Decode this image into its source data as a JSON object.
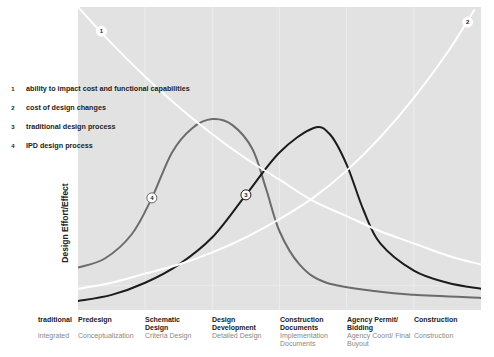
{
  "chart_data": {
    "type": "line",
    "title": "",
    "ylabel": "Design Effort/Effect",
    "xlabel": "",
    "grid": "vertical, faint, at phase boundaries",
    "plot_area": {
      "x0": 78,
      "y0": 7,
      "x1": 481,
      "y1": 310
    },
    "x_categories_traditional": [
      "Predesign",
      "Schematic Design",
      "Design Development",
      "Construction Documents",
      "Agency Permit/ Bidding",
      "Construction"
    ],
    "x_categories_integrated": [
      "Conceptualization",
      "Criteria Design",
      "Detailed Design",
      "Implementation Documents",
      "Agency Coord/ Final Buyout",
      "Construction"
    ],
    "x_range": [
      0,
      6
    ],
    "y_range": [
      0,
      100
    ],
    "series": [
      {
        "id": "1",
        "name": "ability to impact cost and functional capabilities",
        "color": "#ffffff",
        "width": 2,
        "points": [
          [
            0.0,
            100
          ],
          [
            0.5,
            88
          ],
          [
            1.0,
            77
          ],
          [
            1.5,
            67
          ],
          [
            2.0,
            58
          ],
          [
            2.5,
            50
          ],
          [
            3.0,
            43
          ],
          [
            3.5,
            36
          ],
          [
            4.0,
            31
          ],
          [
            4.5,
            26
          ],
          [
            5.0,
            22
          ],
          [
            5.5,
            18
          ],
          [
            6.0,
            15
          ]
        ],
        "marker": {
          "x": 0.35,
          "y": 92
        }
      },
      {
        "id": "2",
        "name": "cost of design changes",
        "color": "#ffffff",
        "width": 2,
        "points": [
          [
            0.0,
            7
          ],
          [
            0.5,
            9
          ],
          [
            1.0,
            12
          ],
          [
            1.5,
            15
          ],
          [
            2.0,
            19
          ],
          [
            2.5,
            24
          ],
          [
            3.0,
            30
          ],
          [
            3.5,
            37
          ],
          [
            4.0,
            46
          ],
          [
            4.5,
            57
          ],
          [
            5.0,
            70
          ],
          [
            5.5,
            85
          ],
          [
            5.9,
            99
          ]
        ],
        "marker": {
          "x": 5.8,
          "y": 95
        }
      },
      {
        "id": "3",
        "name": "traditional design process",
        "color": "#1c1c1c",
        "width": 2,
        "points": [
          [
            0.0,
            3
          ],
          [
            0.5,
            5
          ],
          [
            1.0,
            9
          ],
          [
            1.5,
            15
          ],
          [
            2.0,
            24
          ],
          [
            2.5,
            38
          ],
          [
            3.0,
            52
          ],
          [
            3.5,
            60
          ],
          [
            3.75,
            58
          ],
          [
            4.0,
            48
          ],
          [
            4.25,
            33
          ],
          [
            4.5,
            22
          ],
          [
            5.0,
            13
          ],
          [
            5.5,
            9
          ],
          [
            6.0,
            7
          ]
        ],
        "marker": {
          "x": 2.5,
          "y": 38
        }
      },
      {
        "id": "4",
        "name": "IPD design process",
        "color": "#6b6b6b",
        "width": 2,
        "points": [
          [
            0.0,
            14
          ],
          [
            0.4,
            17
          ],
          [
            0.8,
            25
          ],
          [
            1.1,
            37
          ],
          [
            1.4,
            52
          ],
          [
            1.7,
            60
          ],
          [
            2.0,
            63
          ],
          [
            2.3,
            61
          ],
          [
            2.6,
            53
          ],
          [
            2.8,
            40
          ],
          [
            3.0,
            26
          ],
          [
            3.3,
            15
          ],
          [
            3.7,
            9
          ],
          [
            4.5,
            6
          ],
          [
            5.0,
            5
          ],
          [
            6.0,
            4
          ]
        ],
        "marker": {
          "x": 1.1,
          "y": 37
        }
      }
    ]
  },
  "legend": [
    {
      "num": "1",
      "label": "ability to impact cost and functional capabilities"
    },
    {
      "num": "2",
      "label": "cost of design changes"
    },
    {
      "num": "3",
      "label": "traditional design process"
    },
    {
      "num": "4",
      "label": "IPD design process"
    }
  ],
  "axis": {
    "ylabel": "Design Effort/Effect"
  },
  "rows": {
    "traditional": "traditional",
    "integrated": "integrated"
  },
  "phases": [
    {
      "traditional": "Predesign",
      "integrated": "Conceptualization"
    },
    {
      "traditional": "Schematic Design",
      "integrated": "Criteria Design"
    },
    {
      "traditional": "Design Development",
      "integrated": "Detailed Design"
    },
    {
      "traditional": "Construction Documents",
      "integrated": "Implementation Documents"
    },
    {
      "traditional": "Agency Permit/ Bidding",
      "integrated": "Agency Coord/ Final Buyout"
    },
    {
      "traditional": "Construction",
      "integrated": "Construction"
    }
  ],
  "colors": {
    "plot_bg": "#e2e2e2",
    "grid": "#ececec"
  }
}
